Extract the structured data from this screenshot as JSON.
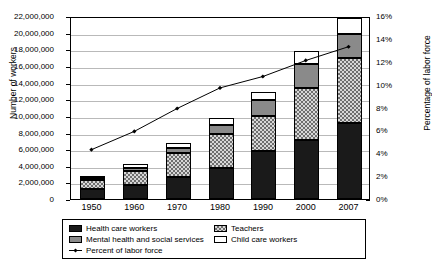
{
  "chart_data": {
    "type": "bar",
    "title": "",
    "subtitle": "",
    "xlabel": "",
    "ylabel": "Number of workers",
    "y2label": "Percentage of labor force",
    "categories": [
      "1950",
      "1960",
      "1970",
      "1980",
      "1990",
      "2000",
      "2007"
    ],
    "ylim": [
      0,
      22000000
    ],
    "y2lim": [
      0,
      16
    ],
    "ytick_labels": [
      "22,000,000",
      "20,000,000",
      "18,000,000",
      "16,000,000",
      "14,000,000",
      "12,000,000",
      "10,000,000",
      "8,000,000",
      "6,000,000",
      "4,000,000",
      "2,000,000",
      "0"
    ],
    "ytick_values": [
      22000000,
      20000000,
      18000000,
      16000000,
      14000000,
      12000000,
      10000000,
      8000000,
      6000000,
      4000000,
      2000000,
      0
    ],
    "y2tick_labels": [
      "16%",
      "14%",
      "12%",
      "10%",
      "8%",
      "6%",
      "4%",
      "2%",
      "0%"
    ],
    "y2tick_values": [
      16,
      14,
      12,
      10,
      8,
      6,
      4,
      2,
      0
    ],
    "grid": true,
    "legend_position": "below",
    "stacked": true,
    "series": [
      {
        "name": "Health care workers",
        "color": "#1a1a1a",
        "pattern": "solid-black",
        "axis": "left",
        "values": [
          1200000,
          1650000,
          2600000,
          3700000,
          5800000,
          7100000,
          9100000
        ]
      },
      {
        "name": "Teachers",
        "color": "#d7d7d7",
        "pattern": "checkered",
        "axis": "left",
        "values": [
          1100000,
          1700000,
          2900000,
          4100000,
          4200000,
          6200000,
          7900000
        ]
      },
      {
        "name": "Mental health and social services",
        "color": "#8a8a8a",
        "pattern": "solid-gray",
        "axis": "left",
        "values": [
          200000,
          350000,
          650000,
          1100000,
          1900000,
          2900000,
          2900000
        ]
      },
      {
        "name": "Child care workers",
        "color": "#ffffff",
        "pattern": "solid-white",
        "axis": "left",
        "values": [
          300000,
          500000,
          550000,
          900000,
          1000000,
          1600000,
          1900000
        ]
      }
    ],
    "line_series": {
      "name": "Percent of labor force",
      "color": "#000000",
      "axis": "right",
      "marker": "diamond",
      "values": [
        4.4,
        6.0,
        8.0,
        9.8,
        10.8,
        12.2,
        13.4
      ]
    },
    "legend_items": [
      {
        "label": "Health care workers",
        "swatch": "health"
      },
      {
        "label": "Teachers",
        "swatch": "teachers"
      },
      {
        "label": "Mental health and social services",
        "swatch": "mental"
      },
      {
        "label": "Child care workers",
        "swatch": "child"
      },
      {
        "label": "Percent of labor force",
        "swatch": "line"
      }
    ]
  }
}
